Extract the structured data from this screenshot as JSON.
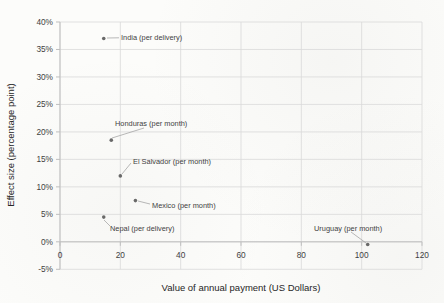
{
  "chart_data": {
    "type": "scatter",
    "title": "",
    "xlabel": "Value of annual payment (US Dollars)",
    "ylabel": "Effect size (percentage point)",
    "xlim": [
      0,
      120
    ],
    "ylim": [
      -5,
      40
    ],
    "x_ticks": [
      0,
      20,
      40,
      60,
      80,
      100,
      120
    ],
    "y_ticks": [
      40,
      35,
      30,
      25,
      20,
      15,
      10,
      5,
      0,
      -5
    ],
    "y_tick_format": "percent",
    "grid": true,
    "legend": false,
    "points": [
      {
        "label": "India (per delivery)",
        "x": 14.5,
        "y": 37,
        "label_px": [
          121,
          37.5
        ],
        "leader": [
          [
            107,
            38
          ],
          [
            119,
            37.8
          ]
        ]
      },
      {
        "label": "Honduras (per month)",
        "x": 17,
        "y": 18.5,
        "label_px": [
          115,
          123
        ],
        "leader": [
          [
            112,
            138
          ],
          [
            144,
            128
          ]
        ]
      },
      {
        "label": "El Salvador (per month)",
        "x": 20,
        "y": 12,
        "label_px": [
          133,
          161
        ],
        "leader": [
          [
            122,
            174
          ],
          [
            131,
            163
          ]
        ]
      },
      {
        "label": "Mexico (per month)",
        "x": 25,
        "y": 7.5,
        "label_px": [
          152,
          205
        ],
        "leader": [
          [
            138,
            201
          ],
          [
            150,
            204
          ]
        ]
      },
      {
        "label": "Nepal (per delivery)",
        "x": 14.5,
        "y": 4.5,
        "label_px": [
          110,
          228
        ],
        "leader": [
          [
            104,
            220
          ],
          [
            110,
            226
          ]
        ]
      },
      {
        "label": "Uruguay (per month)",
        "x": 102,
        "y": -0.5,
        "label_px": [
          314,
          228
        ],
        "leader": [
          [
            351,
            232
          ],
          [
            366,
            243
          ]
        ]
      }
    ],
    "colors": {
      "marker": "#595959",
      "gridline": "#d9d9d9",
      "axis_line": "#bfbfbf",
      "leader_line": "#a6a6a6",
      "tick_text": "#3f3f3f",
      "title_text": "#262626"
    },
    "plot_area_px": {
      "left": 60,
      "right": 422,
      "top": 22,
      "bottom": 269.3
    }
  }
}
